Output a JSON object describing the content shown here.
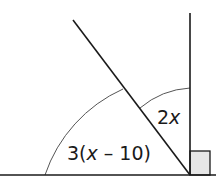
{
  "diagram": {
    "type": "angle-diagram",
    "labels": {
      "angle_left": {
        "prefix": "3(",
        "var": "x",
        "suffix": " – 10)"
      },
      "angle_right": {
        "prefix": "2",
        "var": "x"
      }
    },
    "right_angle_marker": true,
    "colors": {
      "line": "#1a1a1a",
      "arc": "#555555",
      "right_angle_fill": "#e6e6e6"
    }
  }
}
